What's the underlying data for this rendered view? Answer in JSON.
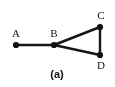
{
  "figure": {
    "caption": "(a)",
    "background_color": "#ffffff",
    "ink_color": "#161616",
    "type": "graph-diagram"
  },
  "nodes": [
    {
      "id": "A",
      "label": "A",
      "x": 16,
      "y": 45,
      "label_x": 16,
      "label_y": 33,
      "radius": 3.1
    },
    {
      "id": "B",
      "label": "B",
      "x": 54,
      "y": 45,
      "label_x": 54,
      "label_y": 33,
      "radius": 3.1
    },
    {
      "id": "C",
      "label": "C",
      "x": 100,
      "y": 27,
      "label_x": 101,
      "label_y": 15,
      "radius": 3.1
    },
    {
      "id": "D",
      "label": "D",
      "x": 100,
      "y": 55,
      "label_x": 101,
      "label_y": 65,
      "radius": 3.1
    }
  ],
  "edges": [
    {
      "id": "edge-ab",
      "from": "A",
      "to": "B",
      "width": 2.6
    },
    {
      "id": "edge-bc",
      "from": "B",
      "to": "C",
      "width": 2.6
    },
    {
      "id": "edge-bd",
      "from": "B",
      "to": "D",
      "width": 2.6
    },
    {
      "id": "edge-cd",
      "from": "C",
      "to": "D",
      "width": 2.4
    }
  ],
  "caption_pos": {
    "x": 57,
    "y": 73
  }
}
